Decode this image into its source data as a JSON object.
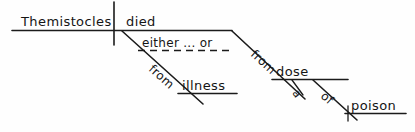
{
  "diagram": {
    "kind": "reed-kellogg-sentence-diagram",
    "sentence": "Themistocles died either from illness or from a dose of poison.",
    "ink_color": "#151515",
    "background_color": "#fefefe",
    "nodes": {
      "subject": "Themistocles",
      "verb": "died",
      "correlative": "either ... or",
      "prep_left": "from",
      "object_left": "illness",
      "prep_right": "from",
      "object_right": "dose",
      "article": "a",
      "prep_of": "of",
      "object_of": "poison"
    }
  }
}
